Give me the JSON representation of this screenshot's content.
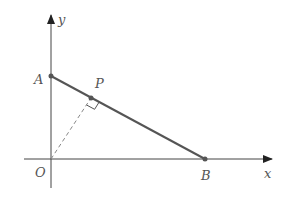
{
  "diagram": {
    "axes": {
      "x_label": "x",
      "y_label": "y"
    },
    "points": {
      "origin": "O",
      "A": "A",
      "B": "B",
      "P": "P"
    },
    "colors": {
      "line": "#555555",
      "axis": "#333333",
      "dashed": "#888888"
    }
  }
}
